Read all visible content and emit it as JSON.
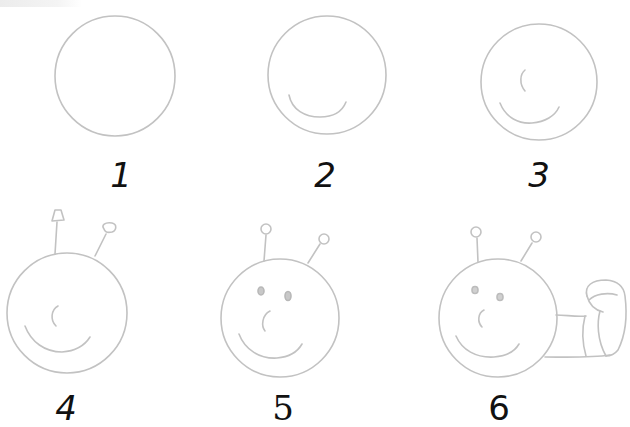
{
  "stroke_color": "#c2c2c2",
  "label_color": "#111111",
  "steps": [
    {
      "number": "1",
      "description": "Draw a circle"
    },
    {
      "number": "2",
      "description": "Add a smiling mouth"
    },
    {
      "number": "3",
      "description": "Add a nose"
    },
    {
      "number": "4",
      "description": "Add two antennae"
    },
    {
      "number": "5",
      "description": "Add two eyes"
    },
    {
      "number": "6",
      "description": "Add the segmented body"
    }
  ]
}
